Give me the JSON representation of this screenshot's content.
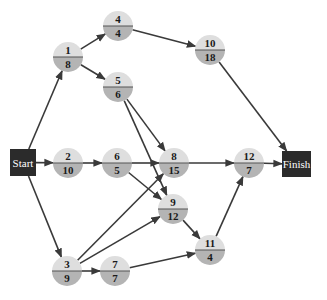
{
  "diagram": {
    "type": "activity-on-node network",
    "start": {
      "id": "start",
      "label": "Start",
      "x": 10,
      "y": 149,
      "w": 26,
      "h": 27
    },
    "finish": {
      "id": "finish",
      "label": "Finish",
      "x": 282,
      "y": 151,
      "w": 29,
      "h": 26
    },
    "node_radius": 15,
    "colors": {
      "box_fill": "#2b2b2b",
      "node_top": "#dedede",
      "node_bottom": "#b4b4b4",
      "divider": "#555555",
      "edge": "#3a3a3a"
    },
    "nodes": [
      {
        "id": "1",
        "activity": "1",
        "duration": "8",
        "cx": 68,
        "cy": 57
      },
      {
        "id": "2",
        "activity": "2",
        "duration": "10",
        "cx": 68,
        "cy": 163
      },
      {
        "id": "3",
        "activity": "3",
        "duration": "9",
        "cx": 67,
        "cy": 271
      },
      {
        "id": "4",
        "activity": "4",
        "duration": "4",
        "cx": 118,
        "cy": 26
      },
      {
        "id": "5",
        "activity": "5",
        "duration": "6",
        "cx": 118,
        "cy": 87
      },
      {
        "id": "6",
        "activity": "6",
        "duration": "5",
        "cx": 117,
        "cy": 163
      },
      {
        "id": "7",
        "activity": "7",
        "duration": "7",
        "cx": 115,
        "cy": 271
      },
      {
        "id": "8",
        "activity": "8",
        "duration": "15",
        "cx": 174,
        "cy": 163
      },
      {
        "id": "9",
        "activity": "9",
        "duration": "12",
        "cx": 173,
        "cy": 209
      },
      {
        "id": "10",
        "activity": "10",
        "duration": "18",
        "cx": 210,
        "cy": 50
      },
      {
        "id": "11",
        "activity": "11",
        "duration": "4",
        "cx": 210,
        "cy": 250
      },
      {
        "id": "12",
        "activity": "12",
        "duration": "7",
        "cx": 249,
        "cy": 163
      }
    ],
    "edges": [
      {
        "from": "start",
        "to": "1"
      },
      {
        "from": "start",
        "to": "2"
      },
      {
        "from": "start",
        "to": "3"
      },
      {
        "from": "1",
        "to": "4"
      },
      {
        "from": "1",
        "to": "5"
      },
      {
        "from": "4",
        "to": "10"
      },
      {
        "from": "5",
        "to": "8"
      },
      {
        "from": "5",
        "to": "9"
      },
      {
        "from": "2",
        "to": "6"
      },
      {
        "from": "6",
        "to": "8"
      },
      {
        "from": "6",
        "to": "9"
      },
      {
        "from": "3",
        "to": "7"
      },
      {
        "from": "3",
        "to": "8"
      },
      {
        "from": "3",
        "to": "9"
      },
      {
        "from": "7",
        "to": "11"
      },
      {
        "from": "9",
        "to": "11"
      },
      {
        "from": "8",
        "to": "12"
      },
      {
        "from": "11",
        "to": "12"
      },
      {
        "from": "10",
        "to": "finish"
      },
      {
        "from": "12",
        "to": "finish"
      }
    ]
  }
}
